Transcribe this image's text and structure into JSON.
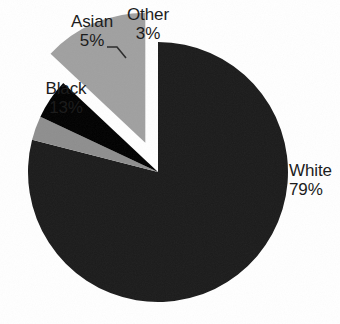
{
  "chart_data": {
    "type": "pie",
    "title": "",
    "categories": [
      "White",
      "Black",
      "Asian",
      "Other"
    ],
    "values": [
      79,
      13,
      5,
      3
    ],
    "unit": "%",
    "legend": "none",
    "labels_position": "outside-and-inside",
    "start_angle_deg": 0,
    "direction": "clockwise",
    "exploded_slices": [
      "Black"
    ],
    "slices": [
      {
        "name": "White",
        "value": 79,
        "label": "White",
        "value_label": "79%",
        "color": "#1b1b1b",
        "exploded": false,
        "label_placement": "outside-right"
      },
      {
        "name": "Black",
        "value": 13,
        "label": "Black",
        "value_label": "13%",
        "color": "#a0a0a0",
        "exploded": true,
        "label_placement": "inside"
      },
      {
        "name": "Asian",
        "value": 5,
        "label": "Asian",
        "value_label": "5%",
        "color": "#000000",
        "exploded": false,
        "label_placement": "outside-top-leader"
      },
      {
        "name": "Other",
        "value": 3,
        "label": "Other",
        "value_label": "3%",
        "color": "#8e8e8e",
        "exploded": false,
        "label_placement": "outside-top"
      }
    ],
    "colors": {
      "white_slice": "#1b1b1b",
      "black_slice": "#a0a0a0",
      "asian_slice": "#000000",
      "other_slice": "#8e8e8e",
      "background": "#ffffff",
      "text": "#1c1c1c",
      "leader_line": "#2a2a2a"
    }
  }
}
